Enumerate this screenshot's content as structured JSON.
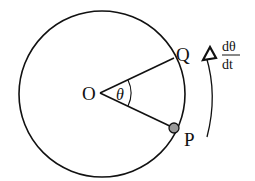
{
  "diagram": {
    "labels": {
      "center": "O",
      "point_q": "Q",
      "point_p": "P",
      "angle": "θ",
      "rate_numerator": "dθ",
      "rate_denominator": "dt"
    },
    "colors": {
      "stroke": "#111111",
      "point_fill": "#999999",
      "background": "#ffffff"
    }
  }
}
